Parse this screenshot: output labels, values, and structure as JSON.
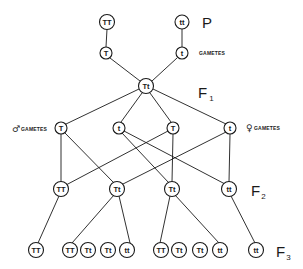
{
  "diagram": {
    "colors": {
      "line": "#1a1a1a",
      "background": "#ffffff"
    },
    "generation_labels": {
      "P": {
        "main": "P",
        "sub": ""
      },
      "F1": {
        "main": "F",
        "sub": "1"
      },
      "F2": {
        "main": "F",
        "sub": "2"
      },
      "F3": {
        "main": "F",
        "sub": "3"
      }
    },
    "labels": {
      "parent_gametes": "GAMETES",
      "male_gametes_symbol": "♂",
      "male_gametes": "GAMETES",
      "female_gametes_symbol": "♀",
      "female_gametes": "GAMETES"
    },
    "nodes": {
      "p_TT": "TT",
      "p_tt": "tt",
      "pg_T": "T",
      "pg_t": "t",
      "f1_Tt": "Tt",
      "m_T": "T",
      "m_t": "t",
      "f_T": "T",
      "f_t": "t",
      "f2_TT": "TT",
      "f2_Tt_a": "Tt",
      "f2_Tt_b": "Tt",
      "f2_tt": "tt",
      "f3_1": "TT",
      "f3_2": "TT",
      "f3_3": "Tt",
      "f3_4": "Tt",
      "f3_5": "tt",
      "f3_6": "TT",
      "f3_7": "Tt",
      "f3_8": "Tt",
      "f3_9": "tt",
      "f3_10": "tt"
    }
  }
}
